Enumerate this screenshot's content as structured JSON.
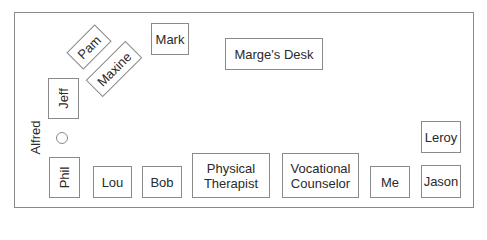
{
  "diagram": {
    "colors": {
      "border": "#8a8a8a",
      "text": "#2a2a2a",
      "background": "#ffffff"
    },
    "desks": {
      "pam": "Pam",
      "mark": "Mark",
      "maxine": "Maxine",
      "marge": "Marge's Desk",
      "jeff": "Jeff",
      "phil": "Phil",
      "lou": "Lou",
      "bob": "Bob",
      "physical_therapist_line1": "Physical",
      "physical_therapist_line2": "Therapist",
      "vocational_counselor_line1": "Vocational",
      "vocational_counselor_line2": "Counselor",
      "me": "Me",
      "leroy": "Leroy",
      "jason": "Jason"
    },
    "people_without_desk": {
      "alfred": "Alfred"
    }
  }
}
